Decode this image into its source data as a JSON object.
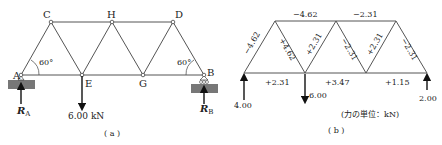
{
  "panel_a": {
    "caption": "( a )",
    "nodes": {
      "A": "A",
      "B": "B",
      "C": "C",
      "D": "D",
      "E": "E",
      "G": "G",
      "H": "H"
    },
    "angle_left": "60°",
    "angle_right": "60°",
    "load": "6.00 kN",
    "reaction_a": "R",
    "reaction_a_sub": "A",
    "reaction_b": "R",
    "reaction_b_sub": "B"
  },
  "panel_b": {
    "caption": "( b )",
    "members": {
      "AC": "−4.62",
      "CE": "+4.62",
      "CH": "−4.62",
      "EH": "+2.31",
      "HG": "−2.31",
      "HD": "−2.31",
      "GD": "+2.31",
      "DB": "−2.31",
      "AE": "+2.31",
      "EG": "+3.47",
      "GB": "+1.15"
    },
    "reaction_left": "4.00",
    "load": "6.00",
    "reaction_right": "2.00",
    "unit_note": "(力の単位：kN)"
  },
  "colors": {
    "line": "#555555",
    "support": "#777777",
    "text": "#222222"
  }
}
